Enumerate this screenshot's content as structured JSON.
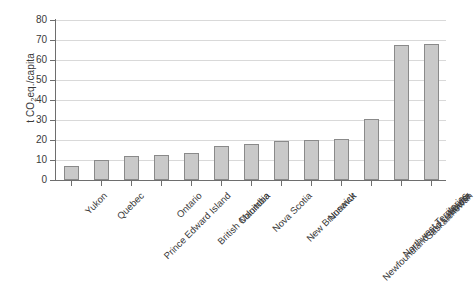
{
  "chart_data": {
    "type": "bar",
    "title": "",
    "subtitle": "",
    "xlabel": "",
    "ylabel": "t CO2eq./capita",
    "ylabel_parts": {
      "prefix": "t CO",
      "sub": "2",
      "suffix": "eq./capita"
    },
    "categories": [
      "Yukon",
      "Quebec",
      "Prince Edward Island",
      "Ontario",
      "British Columbia",
      "Manitoba",
      "Nova Scotia",
      "New Brunswick",
      "Nunavut",
      "Newfoundland and Labrador",
      "Northwest Territories",
      "Saskatchewan",
      "Alberta"
    ],
    "values": [
      7,
      10,
      12.2,
      12.3,
      13.3,
      16.8,
      17.8,
      19.4,
      19.8,
      20.5,
      30.5,
      67.3,
      67.8
    ],
    "ylim": [
      0,
      80
    ],
    "yticks": [
      0,
      10,
      20,
      30,
      40,
      50,
      60,
      70,
      80
    ],
    "ytick_labels": [
      "0",
      "10",
      "20",
      "30",
      "40",
      "50",
      "60",
      "70",
      "80"
    ],
    "grid": true,
    "grid_axis": "y",
    "legend": false,
    "legend_position": "none",
    "bar_fill_color": "#c9c9c9",
    "bar_edge_color": "#8a8a8a",
    "gridline_color": "#d9d9d9",
    "axis_color": "#6e6e6e",
    "text_color": "#3a3a3a",
    "background_color": "#ffffff",
    "xtick_label_rotation": -45
  }
}
